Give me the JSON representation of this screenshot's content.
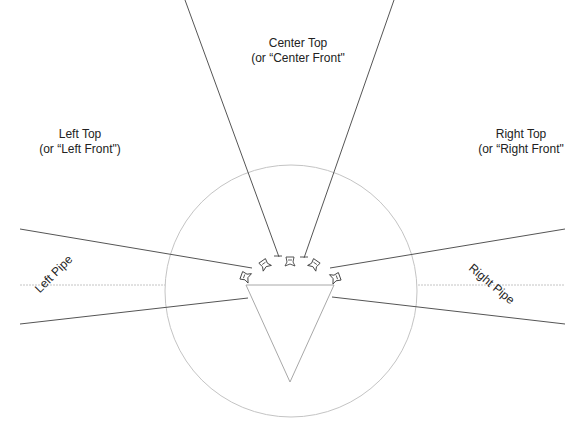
{
  "diagram": {
    "colors": {
      "zone_line": "#555555",
      "circle": "#bdbdbd",
      "cone": "#9e9e9e",
      "dotted": "#bdbdbd",
      "text": "#222222"
    },
    "labels": {
      "center_top": {
        "line1": "Center Top",
        "line2": "(or “Center Front\""
      },
      "left_top": {
        "line1": "Left Top",
        "line2": "(or “Left Front\")"
      },
      "right_top": {
        "line1": "Right Top",
        "line2": "(or “Right Front\""
      },
      "left_pipe": "Left Pipe",
      "right_pipe": "Right Pipe"
    },
    "microphones": [
      {
        "id": "mic-left-pipe",
        "x": 246,
        "y": 276,
        "rot": -70
      },
      {
        "id": "mic-left-top",
        "x": 265,
        "y": 264,
        "rot": -35
      },
      {
        "id": "mic-center-top",
        "x": 290,
        "y": 261,
        "rot": 0
      },
      {
        "id": "mic-right-top",
        "x": 314,
        "y": 265,
        "rot": 35
      },
      {
        "id": "mic-right-pipe",
        "x": 335,
        "y": 277,
        "rot": 70
      }
    ]
  }
}
